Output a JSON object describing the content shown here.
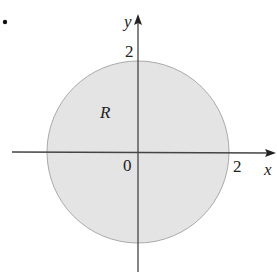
{
  "diagram": {
    "item_marker": ".",
    "region": {
      "label": "R",
      "shape": "disk",
      "center": [
        0,
        0
      ],
      "radius": 2,
      "fill_color": "#e4e4e4",
      "edge_color": "#aaaaaa"
    },
    "axes": {
      "x_label": "x",
      "y_label": "y",
      "origin_label": "0",
      "x_tick_label": "2",
      "y_tick_label": "2",
      "axis_color": "#444444"
    }
  }
}
